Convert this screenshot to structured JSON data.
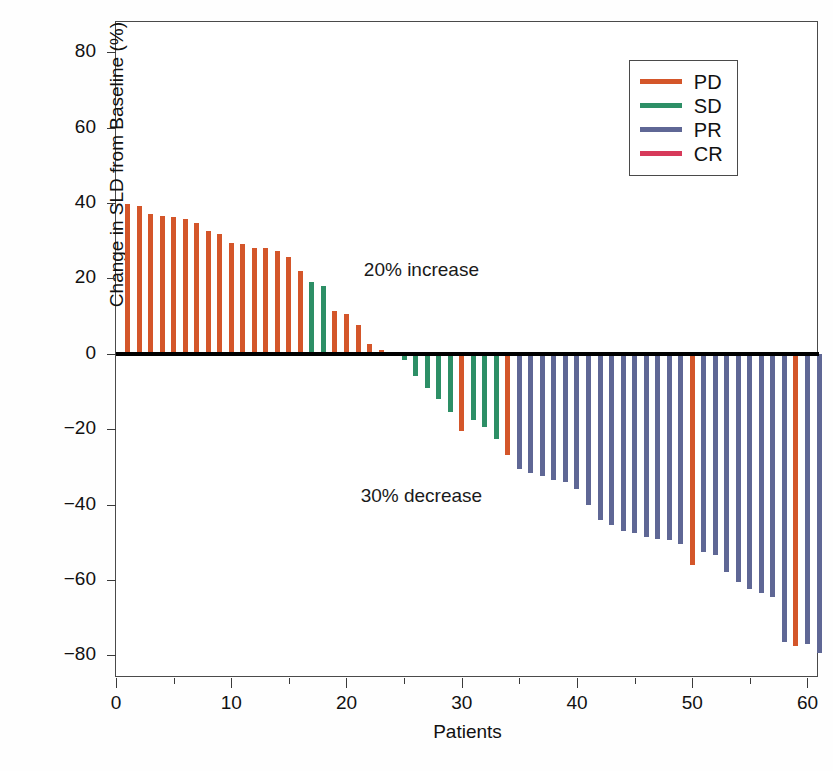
{
  "chart_data": {
    "type": "bar",
    "title": "",
    "xlabel": "Patients",
    "ylabel": "Change in SLD from Baseline (%)",
    "xlim": [
      0,
      61
    ],
    "ylim": [
      -86,
      88
    ],
    "ytick_values": [
      80,
      60,
      40,
      20,
      0,
      -20,
      -40,
      -60,
      -80
    ],
    "ytick_labels": [
      "80",
      "60",
      "40",
      "20",
      "0",
      "−20",
      "−40",
      "−60",
      "−80"
    ],
    "xtick_values": [
      0,
      10,
      20,
      30,
      40,
      50,
      60
    ],
    "xtick_labels": [
      "0",
      "10",
      "20",
      "30",
      "40",
      "50",
      "60"
    ],
    "xtick_minor_values": [
      5,
      15,
      25,
      35,
      45,
      55
    ],
    "grid": false,
    "zero_reference_line": true,
    "legend_position": "top-right",
    "legend": [
      {
        "label": "PD",
        "color": "#d4562a"
      },
      {
        "label": "SD",
        "color": "#2d8f66"
      },
      {
        "label": "PR",
        "color": "#5f6795"
      },
      {
        "label": "CR",
        "color": "#d73a5a"
      }
    ],
    "annotations": [
      {
        "text": "20% increase",
        "x": 26.5,
        "y": 22
      },
      {
        "text": "30% decrease",
        "x": 26.5,
        "y": -38
      }
    ],
    "series_note": "Waterfall plot: one bar per patient, sorted descending by percent change in SLD.",
    "bars": [
      {
        "patient": 1,
        "value": 39.6,
        "response": "PD"
      },
      {
        "patient": 2,
        "value": 39.3,
        "response": "PD"
      },
      {
        "patient": 3,
        "value": 37.2,
        "response": "PD"
      },
      {
        "patient": 4,
        "value": 36.6,
        "response": "PD"
      },
      {
        "patient": 5,
        "value": 36.3,
        "response": "PD"
      },
      {
        "patient": 6,
        "value": 35.8,
        "response": "PD"
      },
      {
        "patient": 7,
        "value": 34.8,
        "response": "PD"
      },
      {
        "patient": 8,
        "value": 32.5,
        "response": "PD"
      },
      {
        "patient": 9,
        "value": 31.8,
        "response": "PD"
      },
      {
        "patient": 10,
        "value": 29.4,
        "response": "PD"
      },
      {
        "patient": 11,
        "value": 29.2,
        "response": "PD"
      },
      {
        "patient": 12,
        "value": 28.0,
        "response": "PD"
      },
      {
        "patient": 13,
        "value": 28.1,
        "response": "PD"
      },
      {
        "patient": 14,
        "value": 27.2,
        "response": "PD"
      },
      {
        "patient": 15,
        "value": 25.8,
        "response": "PD"
      },
      {
        "patient": 16,
        "value": 22.0,
        "response": "PD"
      },
      {
        "patient": 17,
        "value": 19.0,
        "response": "SD"
      },
      {
        "patient": 18,
        "value": 18.0,
        "response": "SD"
      },
      {
        "patient": 19,
        "value": 11.3,
        "response": "PD"
      },
      {
        "patient": 20,
        "value": 10.6,
        "response": "PD"
      },
      {
        "patient": 21,
        "value": 7.6,
        "response": "PD"
      },
      {
        "patient": 22,
        "value": 2.6,
        "response": "PD"
      },
      {
        "patient": 23,
        "value": 0.9,
        "response": "PD"
      },
      {
        "patient": 24,
        "value": -0.5,
        "response": "PD"
      },
      {
        "patient": 25,
        "value": -1.6,
        "response": "SD"
      },
      {
        "patient": 26,
        "value": -6.0,
        "response": "SD"
      },
      {
        "patient": 27,
        "value": -9.0,
        "response": "SD"
      },
      {
        "patient": 28,
        "value": -12.0,
        "response": "SD"
      },
      {
        "patient": 29,
        "value": -15.5,
        "response": "SD"
      },
      {
        "patient": 30,
        "value": -20.5,
        "response": "PD"
      },
      {
        "patient": 31,
        "value": -17.5,
        "response": "SD"
      },
      {
        "patient": 32,
        "value": -19.5,
        "response": "SD"
      },
      {
        "patient": 33,
        "value": -22.5,
        "response": "SD"
      },
      {
        "patient": 34,
        "value": -26.8,
        "response": "PD"
      },
      {
        "patient": 35,
        "value": -30.5,
        "response": "PR"
      },
      {
        "patient": 36,
        "value": -31.5,
        "response": "PR"
      },
      {
        "patient": 37,
        "value": -32.5,
        "response": "PR"
      },
      {
        "patient": 38,
        "value": -33.5,
        "response": "PR"
      },
      {
        "patient": 39,
        "value": -34.0,
        "response": "PR"
      },
      {
        "patient": 40,
        "value": -36.0,
        "response": "PR"
      },
      {
        "patient": 41,
        "value": -40.0,
        "response": "PR"
      },
      {
        "patient": 42,
        "value": -44.0,
        "response": "PR"
      },
      {
        "patient": 43,
        "value": -45.5,
        "response": "PR"
      },
      {
        "patient": 44,
        "value": -47.0,
        "response": "PR"
      },
      {
        "patient": 45,
        "value": -47.5,
        "response": "PR"
      },
      {
        "patient": 46,
        "value": -48.5,
        "response": "PR"
      },
      {
        "patient": 47,
        "value": -49.0,
        "response": "PR"
      },
      {
        "patient": 48,
        "value": -49.5,
        "response": "PR"
      },
      {
        "patient": 49,
        "value": -50.5,
        "response": "PR"
      },
      {
        "patient": 50,
        "value": -56.0,
        "response": "PD"
      },
      {
        "patient": 51,
        "value": -52.5,
        "response": "PR"
      },
      {
        "patient": 52,
        "value": -53.5,
        "response": "PR"
      },
      {
        "patient": 53,
        "value": -58.0,
        "response": "PR"
      },
      {
        "patient": 54,
        "value": -60.5,
        "response": "PR"
      },
      {
        "patient": 55,
        "value": -62.5,
        "response": "PR"
      },
      {
        "patient": 56,
        "value": -63.5,
        "response": "PR"
      },
      {
        "patient": 57,
        "value": -64.5,
        "response": "PR"
      },
      {
        "patient": 58,
        "value": -76.5,
        "response": "PR"
      },
      {
        "patient": 59,
        "value": -77.5,
        "response": "PD"
      },
      {
        "patient": 60,
        "value": -77.0,
        "response": "PR"
      },
      {
        "patient": 61,
        "value": -79.5,
        "response": "PR"
      }
    ]
  }
}
